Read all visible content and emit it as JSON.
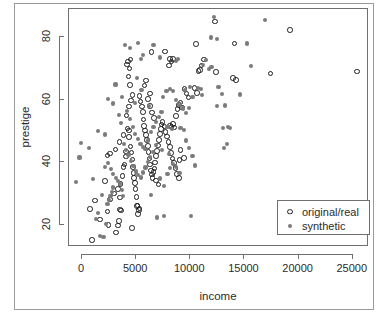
{
  "chart_data": {
    "type": "scatter",
    "title": "",
    "xlabel": "income",
    "ylabel": "prestige",
    "xlim": [
      -1200,
      26500
    ],
    "ylim": [
      13,
      89
    ],
    "xticks": [
      0,
      5000,
      10000,
      15000,
      20000,
      25000
    ],
    "xticklabels": [
      "0",
      "5000",
      "10000",
      "15000",
      "20000",
      "25000"
    ],
    "yticks": [
      20,
      40,
      60,
      80
    ],
    "yticklabels": [
      "20",
      "40",
      "60",
      "80"
    ],
    "grid": false,
    "legend": {
      "position": "bottom-right",
      "entries": [
        {
          "label": "original/real",
          "marker": "open-circle",
          "color": "#1c1c1c"
        },
        {
          "label": "synthetic",
          "marker": "filled-circle",
          "color": "#7b7b7b"
        }
      ]
    },
    "series": [
      {
        "name": "original/real",
        "marker": "open-circle",
        "color": "#1c1c1c",
        "points": [
          [
            930,
            15.3
          ],
          [
            760,
            25.1
          ],
          [
            1656,
            21.8
          ],
          [
            2370,
            24.3
          ],
          [
            2448,
            20.0
          ],
          [
            3161,
            17.6
          ],
          [
            3302,
            19.9
          ],
          [
            3411,
            21.3
          ],
          [
            3485,
            25.0
          ],
          [
            3617,
            24.6
          ],
          [
            3485,
            28.8
          ],
          [
            2594,
            28.2
          ],
          [
            2980,
            30.1
          ],
          [
            3301,
            31.5
          ],
          [
            3554,
            33.1
          ],
          [
            3731,
            35.7
          ],
          [
            3851,
            38.6
          ],
          [
            3912,
            39.4
          ],
          [
            4075,
            41.9
          ],
          [
            4084,
            43.5
          ],
          [
            2370,
            42.2
          ],
          [
            2594,
            42.9
          ],
          [
            3100,
            44.1
          ],
          [
            3455,
            46.5
          ],
          [
            3823,
            48.8
          ],
          [
            4190,
            50.9
          ],
          [
            4325,
            50.2
          ],
          [
            4350,
            48.2
          ],
          [
            4483,
            45.1
          ],
          [
            4563,
            43.2
          ],
          [
            4662,
            41.0
          ],
          [
            4729,
            38.6
          ],
          [
            4765,
            36.7
          ],
          [
            4808,
            35.0
          ],
          [
            4881,
            33.5
          ],
          [
            4946,
            31.6
          ],
          [
            5030,
            29.0
          ],
          [
            5123,
            26.2
          ],
          [
            5237,
            24.9
          ],
          [
            5295,
            25.3
          ],
          [
            4100,
            55.0
          ],
          [
            4330,
            57.9
          ],
          [
            4550,
            59.8
          ],
          [
            4652,
            61.6
          ],
          [
            4460,
            64.8
          ],
          [
            4301,
            67.5
          ],
          [
            4158,
            71.3
          ],
          [
            4239,
            72.2
          ],
          [
            4470,
            72.9
          ],
          [
            4385,
            70.0
          ],
          [
            5310,
            61.2
          ],
          [
            5420,
            59.5
          ],
          [
            5545,
            57.8
          ],
          [
            5610,
            56.2
          ],
          [
            5680,
            53.7
          ],
          [
            5745,
            51.7
          ],
          [
            5820,
            50.2
          ],
          [
            5906,
            48.7
          ],
          [
            5990,
            47.1
          ],
          [
            6070,
            45.2
          ],
          [
            6150,
            43.4
          ],
          [
            6228,
            41.3
          ],
          [
            6300,
            39.3
          ],
          [
            6366,
            37.4
          ],
          [
            6444,
            36.2
          ],
          [
            6512,
            35.1
          ],
          [
            6602,
            36.9
          ],
          [
            6690,
            38.1
          ],
          [
            6760,
            40.0
          ],
          [
            6840,
            42.0
          ],
          [
            6930,
            43.6
          ],
          [
            7010,
            45.4
          ],
          [
            7090,
            47.1
          ],
          [
            7180,
            49.0
          ],
          [
            7270,
            50.6
          ],
          [
            6100,
            60.2
          ],
          [
            6290,
            58.1
          ],
          [
            6480,
            56.0
          ],
          [
            6670,
            54.2
          ],
          [
            6290,
            62.0
          ],
          [
            6420,
            75.3
          ],
          [
            5900,
            66.2
          ],
          [
            5780,
            64.6
          ],
          [
            7350,
            52.1
          ],
          [
            7450,
            53.0
          ],
          [
            7600,
            51.5
          ],
          [
            7720,
            49.8
          ],
          [
            7850,
            48.3
          ],
          [
            7980,
            46.6
          ],
          [
            8100,
            44.9
          ],
          [
            8230,
            43.0
          ],
          [
            8360,
            41.2
          ],
          [
            8500,
            39.9
          ],
          [
            8640,
            38.2
          ],
          [
            8790,
            36.4
          ],
          [
            8930,
            35.0
          ],
          [
            8100,
            51.8
          ],
          [
            8250,
            51.3
          ],
          [
            8400,
            52.3
          ],
          [
            8560,
            51.1
          ],
          [
            8680,
            54.8
          ],
          [
            8810,
            57.1
          ],
          [
            8950,
            58.4
          ],
          [
            9100,
            59.2
          ],
          [
            9250,
            57.5
          ],
          [
            9450,
            63.4
          ],
          [
            9650,
            62.0
          ],
          [
            9840,
            60.8
          ],
          [
            9100,
            43.9
          ],
          [
            9400,
            41.5
          ],
          [
            8150,
            73.0
          ],
          [
            8280,
            72.2
          ],
          [
            8420,
            73.1
          ],
          [
            8050,
            71.0
          ],
          [
            7680,
            75.4
          ],
          [
            10400,
            63.7
          ],
          [
            10600,
            62.1
          ],
          [
            10750,
            69.2
          ],
          [
            10900,
            69.6
          ],
          [
            11250,
            72.9
          ],
          [
            10500,
            77.9
          ],
          [
            11050,
            71.0
          ],
          [
            12400,
            68.9
          ],
          [
            12300,
            85.0
          ],
          [
            14100,
            78.0
          ],
          [
            13950,
            67.0
          ],
          [
            14200,
            66.3
          ],
          [
            17400,
            68.4
          ],
          [
            19200,
            82.3
          ],
          [
            25400,
            69.0
          ],
          [
            2100,
            34.1
          ],
          [
            1220,
            27.8
          ],
          [
            5100,
            26.1
          ],
          [
            5160,
            23.6
          ],
          [
            4600,
            19.0
          ],
          [
            6850,
            34.2
          ],
          [
            7050,
            33.0
          ],
          [
            9000,
            40.8
          ]
        ]
      },
      {
        "name": "synthetic",
        "marker": "filled-circle",
        "color": "#7b7b7b",
        "points": [
          [
            -550,
            33.8
          ],
          [
            -230,
            41.6
          ],
          [
            -100,
            46.3
          ],
          [
            620,
            44.5
          ],
          [
            980,
            34.7
          ],
          [
            1290,
            21.9
          ],
          [
            1480,
            23.8
          ],
          [
            1660,
            16.4
          ],
          [
            1980,
            16.2
          ],
          [
            2180,
            20.4
          ],
          [
            1850,
            29.6
          ],
          [
            2350,
            26.6
          ],
          [
            2530,
            27.9
          ],
          [
            2640,
            29.2
          ],
          [
            2760,
            30.5
          ],
          [
            2880,
            32.0
          ],
          [
            2120,
            38.6
          ],
          [
            2420,
            39.7
          ],
          [
            2650,
            38.0
          ],
          [
            2900,
            36.4
          ],
          [
            3120,
            35.0
          ],
          [
            3340,
            34.2
          ],
          [
            3500,
            33.0
          ],
          [
            3660,
            31.2
          ],
          [
            3820,
            29.4
          ],
          [
            1460,
            50.0
          ],
          [
            2150,
            48.9
          ],
          [
            2400,
            60.2
          ],
          [
            2890,
            58.8
          ],
          [
            3100,
            64.9
          ],
          [
            3420,
            55.2
          ],
          [
            3620,
            52.7
          ],
          [
            3900,
            45.8
          ],
          [
            4080,
            44.0
          ],
          [
            4300,
            42.3
          ],
          [
            4520,
            40.5
          ],
          [
            4760,
            38.8
          ],
          [
            4980,
            37.1
          ],
          [
            5200,
            36.0
          ],
          [
            5420,
            35.2
          ],
          [
            5640,
            36.8
          ],
          [
            5870,
            38.4
          ],
          [
            6090,
            40.1
          ],
          [
            6310,
            41.8
          ],
          [
            6530,
            43.4
          ],
          [
            4000,
            77.5
          ],
          [
            4450,
            76.5
          ],
          [
            5200,
            78.1
          ],
          [
            5430,
            73.0
          ],
          [
            5640,
            74.3
          ],
          [
            3700,
            61.0
          ],
          [
            4150,
            56.5
          ],
          [
            4420,
            53.8
          ],
          [
            4680,
            51.2
          ],
          [
            4920,
            49.0
          ],
          [
            5180,
            47.4
          ],
          [
            5400,
            46.0
          ],
          [
            5620,
            45.0
          ],
          [
            5860,
            44.2
          ],
          [
            6100,
            47.0
          ],
          [
            6350,
            49.6
          ],
          [
            6600,
            51.4
          ],
          [
            6850,
            53.0
          ],
          [
            7100,
            54.5
          ],
          [
            7350,
            56.2
          ],
          [
            6400,
            29.7
          ],
          [
            6900,
            22.4
          ],
          [
            7600,
            22.8
          ],
          [
            7200,
            34.9
          ],
          [
            7600,
            32.4
          ],
          [
            7900,
            36.4
          ],
          [
            8150,
            38.2
          ],
          [
            8400,
            39.4
          ],
          [
            8700,
            38.6
          ],
          [
            9000,
            36.6
          ],
          [
            7500,
            60.8
          ],
          [
            7800,
            62.9
          ],
          [
            8100,
            63.5
          ],
          [
            8400,
            62.7
          ],
          [
            8700,
            60.0
          ],
          [
            9000,
            58.5
          ],
          [
            9300,
            57.2
          ],
          [
            9600,
            55.9
          ],
          [
            9900,
            57.4
          ],
          [
            10200,
            60.9
          ],
          [
            9100,
            51.0
          ],
          [
            9400,
            50.4
          ],
          [
            9600,
            47.0
          ],
          [
            9900,
            44.5
          ],
          [
            10200,
            42.1
          ],
          [
            10100,
            23.0
          ],
          [
            10400,
            39.0
          ],
          [
            10700,
            63.8
          ],
          [
            11000,
            63.4
          ],
          [
            11200,
            71.0
          ],
          [
            11450,
            72.8
          ],
          [
            11700,
            69.9
          ],
          [
            11950,
            70.5
          ],
          [
            12200,
            86.5
          ],
          [
            12600,
            64.1
          ],
          [
            12900,
            61.9
          ],
          [
            13200,
            58.2
          ],
          [
            13000,
            51.0
          ],
          [
            13500,
            51.2
          ],
          [
            13700,
            51.0
          ],
          [
            13400,
            46.0
          ],
          [
            13100,
            44.7
          ],
          [
            12450,
            58.0
          ],
          [
            11900,
            79.9
          ],
          [
            11050,
            61.5
          ],
          [
            14600,
            61.7
          ],
          [
            15200,
            78.0
          ],
          [
            15600,
            70.9
          ],
          [
            16900,
            85.5
          ],
          [
            12500,
            79.3
          ],
          [
            8850,
            73.0
          ],
          [
            8650,
            72.4
          ],
          [
            7200,
            73.5
          ],
          [
            6600,
            77.6
          ],
          [
            5050,
            67.0
          ],
          [
            6200,
            58.0
          ],
          [
            5500,
            63.2
          ],
          [
            4900,
            59.0
          ],
          [
            7900,
            51.4
          ],
          [
            8300,
            50.8
          ],
          [
            9500,
            63.1
          ],
          [
            10000,
            64.0
          ],
          [
            6800,
            45.5
          ],
          [
            7400,
            44.0
          ],
          [
            8000,
            42.8
          ]
        ]
      }
    ]
  }
}
